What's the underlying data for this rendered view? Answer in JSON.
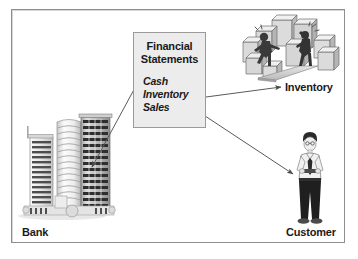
{
  "diagram": {
    "frame": {
      "border_color": "#8e8e8e",
      "background": "#ffffff"
    },
    "center_box": {
      "name": "financial-statements-box",
      "title_line1": "Financial",
      "title_line2": "Statements",
      "fill_color": "#ececec",
      "border_color": "#9a9a9a",
      "items": [
        {
          "label": "Cash"
        },
        {
          "label": "Inventory"
        },
        {
          "label": "Sales"
        }
      ]
    },
    "nodes": [
      {
        "id": "bank",
        "label": "Bank",
        "icon": "office-buildings-icon",
        "position": "bottom-left"
      },
      {
        "id": "inventory",
        "label": "Inventory",
        "icon": "warehouse-workers-boxes-icon",
        "position": "top-right"
      },
      {
        "id": "customer",
        "label": "Customer",
        "icon": "standing-businessman-icon",
        "position": "bottom-right"
      }
    ],
    "arrows": [
      {
        "id": "cash-to-bank",
        "from": "Cash",
        "to": "Bank",
        "direction": "down-left"
      },
      {
        "id": "inventory-to-inventory",
        "from": "Inventory",
        "to": "Inventory",
        "direction": "right"
      },
      {
        "id": "sales-to-customer",
        "from": "Sales",
        "to": "Customer",
        "direction": "down-right"
      }
    ],
    "colors": {
      "line": "#5a5a5a",
      "text": "#1a1a1a",
      "box_fill": "#ececec",
      "art_light": "#e2e2e2",
      "art_mid": "#b4b4b4",
      "art_dark": "#3c3c3c"
    }
  }
}
